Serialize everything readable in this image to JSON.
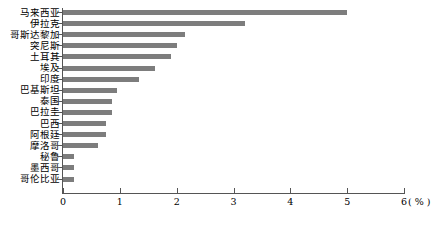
{
  "chart_data": {
    "type": "bar",
    "orientation": "horizontal",
    "title": "",
    "xlabel": "( % )",
    "ylabel": "",
    "xlim": [
      0,
      6
    ],
    "xticks": [
      "0",
      "1",
      "2",
      "3",
      "4",
      "5",
      "6"
    ],
    "grid": false,
    "legend": null,
    "bar_color": "#7d7d7d",
    "axis_color": "#555555",
    "categories": [
      "马来西亚",
      "伊拉克",
      "哥斯达黎加",
      "突尼斯",
      "土耳其",
      "埃及",
      "印度",
      "巴基斯坦",
      "泰国",
      "巴拉圭",
      "巴西",
      "阿根廷",
      "摩洛哥",
      "秘鲁",
      "墨西哥",
      "哥伦比亚"
    ],
    "values": [
      5.0,
      3.2,
      2.15,
      2.0,
      1.9,
      1.62,
      1.33,
      0.95,
      0.86,
      0.86,
      0.75,
      0.75,
      0.62,
      0.2,
      0.2,
      0.2
    ]
  },
  "axis": {
    "unit_label": "( % )"
  }
}
